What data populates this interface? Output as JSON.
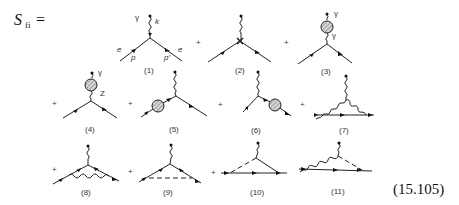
{
  "equation": {
    "lhs": "S",
    "lhs_sub": "fi",
    "equals": "=",
    "plus": "+",
    "equation_number": "(15.105)"
  },
  "diagrams": [
    {
      "index": 1,
      "label": "(1)",
      "particle_labels": {
        "photon": "γ",
        "photon_momentum": "k",
        "electron_in": "e",
        "electron_out": "e",
        "momentum_in": "p",
        "momentum_out": "p′"
      }
    },
    {
      "index": 2,
      "label": "(2)",
      "description": "vertex counterterm"
    },
    {
      "index": 3,
      "label": "(3)",
      "particle_labels": {
        "photon_outer": "γ",
        "photon_inner": "γ"
      },
      "description": "photon self-energy blob"
    },
    {
      "index": 4,
      "label": "(4)",
      "particle_labels": {
        "photon": "γ",
        "z_boson": "Z"
      },
      "description": "γ–Z mixing blob"
    },
    {
      "index": 5,
      "label": "(5)",
      "description": "incoming electron self-energy blob"
    },
    {
      "index": 6,
      "label": "(6)",
      "description": "outgoing electron self-energy blob"
    },
    {
      "index": 7,
      "label": "(7)",
      "description": "triple gauge vertex loop"
    },
    {
      "index": 8,
      "label": "(8)",
      "description": "photon exchange vertex correction"
    },
    {
      "index": 9,
      "label": "(9)",
      "description": "dashed boson exchange vertex correction"
    },
    {
      "index": 10,
      "label": "(10)",
      "description": "dashed triangle with fermion line"
    },
    {
      "index": 11,
      "label": "(11)",
      "description": "mixed wavy/dashed triangle"
    }
  ]
}
